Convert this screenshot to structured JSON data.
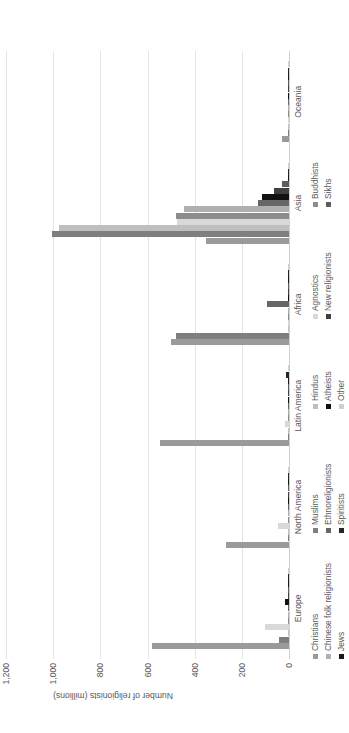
{
  "chart_data": {
    "type": "bar",
    "orientation": "horizontal",
    "title": "",
    "xlabel": "",
    "ylabel": "Number of religionists (millions)",
    "value_axis_label": "Number of religionists (millions)",
    "ylim": [
      0,
      1200
    ],
    "tick_labels": [
      "0",
      "200",
      "400",
      "600",
      "800",
      "1,000",
      "1,200"
    ],
    "tick_values": [
      0,
      200,
      400,
      600,
      800,
      1000,
      1200
    ],
    "grid": true,
    "grid_axis": "value",
    "legend_position": "bottom",
    "legend_columns": 4,
    "categories": [
      "Europe",
      "North America",
      "Latin America",
      "Africa",
      "Asia",
      "Oceania"
    ],
    "series": [
      {
        "name": "Christians",
        "color": "#9a9a9a",
        "values": [
          580,
          268,
          548,
          500,
          352,
          28
        ]
      },
      {
        "name": "Muslims",
        "color": "#7f7f7f",
        "values": [
          44,
          5,
          2,
          480,
          1005,
          0.6
        ]
      },
      {
        "name": "Hindus",
        "color": "#bfbfbf",
        "values": [
          1.5,
          2,
          0.8,
          3,
          975,
          0.5
        ]
      },
      {
        "name": "Agnostics",
        "color": "#d9d9d9",
        "values": [
          103,
          46,
          17,
          6,
          475,
          4
        ]
      },
      {
        "name": "Buddhists",
        "color": "#8c8c8c",
        "values": [
          2,
          4,
          1,
          0.3,
          478,
          0.6
        ]
      },
      {
        "name": "Chinese folk religionists",
        "color": "#b0b0b0",
        "values": [
          0.3,
          1,
          0.2,
          0.1,
          447,
          0.2
        ]
      },
      {
        "name": "Ethnoreligionists",
        "color": "#666666",
        "values": [
          1.2,
          1.2,
          3,
          95,
          132,
          0.4
        ]
      },
      {
        "name": "Atheists",
        "color": "#111111",
        "values": [
          18,
          2,
          3,
          0.6,
          114,
          0.5
        ]
      },
      {
        "name": "New religionists",
        "color": "#3f3f3f",
        "values": [
          0.4,
          1.6,
          0.8,
          0.1,
          62,
          0.1
        ]
      },
      {
        "name": "Sikhs",
        "color": "#5e5e5e",
        "values": [
          0.5,
          0.7,
          0.05,
          0.06,
          28,
          0.05
        ]
      },
      {
        "name": "Jews",
        "color": "#1a1a1a",
        "values": [
          2,
          6,
          0.9,
          0.1,
          6,
          0.1
        ]
      },
      {
        "name": "Spiritists",
        "color": "#262626",
        "values": [
          0.2,
          0.2,
          14,
          0.05,
          0.05,
          0.02
        ]
      },
      {
        "name": "Other",
        "color": "#cfcfcf",
        "values": [
          1,
          1,
          1,
          1,
          2,
          0.3
        ]
      }
    ]
  },
  "legend": {
    "column_1": [
      "Christians",
      "Chinese folk religionists",
      "Jews"
    ],
    "column_2": [
      "Muslims",
      "Ethnoreligionists",
      "Spiritists"
    ],
    "column_3": [
      "Hindus",
      "Atheists",
      "Other"
    ],
    "column_4": [
      "Agnostics",
      "New religionists",
      ""
    ],
    "column_5": [
      "Buddhists",
      "Sikhs",
      ""
    ]
  }
}
